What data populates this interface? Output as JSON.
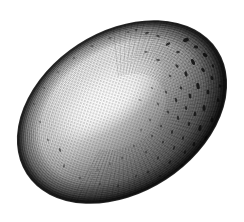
{
  "image": {
    "domain": "Natural-Image",
    "subject_name": "speckled-bird-egg",
    "medium": "engraving-halftone",
    "palette": "monochrome-grayscale",
    "background_color": "#ffffff",
    "outline_color": "#141414",
    "shadow_color": "#1a1a1a",
    "midtone_color": "#8d8d8d",
    "highlight_color": "#ffffff",
    "speckle_color": "#111111",
    "canvas": {
      "width": 244,
      "height": 222
    },
    "caption": ""
  },
  "geometry": {
    "ellipse": {
      "center_x": 122,
      "center_y": 112,
      "radius_x": 113,
      "radius_y": 80,
      "rotation_deg": -33
    },
    "extents": {
      "left_x": 12,
      "right_x": 233,
      "top_y": 14,
      "bottom_y": 210
    },
    "highlight": {
      "center_x": 108,
      "center_y": 98,
      "radius_x": 66,
      "radius_y": 30,
      "rotation_deg": -33
    }
  },
  "shading": {
    "light_direction": "upper-left",
    "darkest_region": "lower-right-rim",
    "terminator_note": "bright diagonal highlight runs lower-left to upper-right through the center",
    "rim_darkening": "continuous dark outline all around the silhouette"
  },
  "texture": {
    "engraving_lines": "fine curved hatching following the shell contour",
    "line_count": 46,
    "speckle_count": 96,
    "speckle_distribution": "dense on the right and upper-right shadowed side, sparse on the lit left side"
  },
  "speckles": [
    {
      "x": 186,
      "y": 40,
      "rx": 3.0,
      "ry": 2.0,
      "r": -24,
      "o": 0.88
    },
    {
      "x": 196,
      "y": 47,
      "rx": 2.2,
      "ry": 1.5,
      "r": 10,
      "o": 0.82
    },
    {
      "x": 205,
      "y": 55,
      "rx": 2.6,
      "ry": 1.7,
      "r": 40,
      "o": 0.9
    },
    {
      "x": 178,
      "y": 52,
      "rx": 1.8,
      "ry": 1.2,
      "r": -10,
      "o": 0.7
    },
    {
      "x": 168,
      "y": 44,
      "rx": 2.4,
      "ry": 1.3,
      "r": -35,
      "o": 0.8
    },
    {
      "x": 158,
      "y": 36,
      "rx": 1.7,
      "ry": 1.1,
      "r": 15,
      "o": 0.62
    },
    {
      "x": 147,
      "y": 33,
      "rx": 2.0,
      "ry": 1.0,
      "r": -20,
      "o": 0.58
    },
    {
      "x": 136,
      "y": 30,
      "rx": 1.5,
      "ry": 1.0,
      "r": 0,
      "o": 0.5
    },
    {
      "x": 193,
      "y": 62,
      "rx": 3.2,
      "ry": 1.6,
      "r": 65,
      "o": 0.92
    },
    {
      "x": 203,
      "y": 70,
      "rx": 2.4,
      "ry": 1.5,
      "r": 55,
      "o": 0.88
    },
    {
      "x": 212,
      "y": 78,
      "rx": 2.0,
      "ry": 1.4,
      "r": 70,
      "o": 0.85
    },
    {
      "x": 186,
      "y": 74,
      "rx": 2.8,
      "ry": 1.4,
      "r": 75,
      "o": 0.86
    },
    {
      "x": 177,
      "y": 66,
      "rx": 2.0,
      "ry": 1.2,
      "r": 50,
      "o": 0.72
    },
    {
      "x": 198,
      "y": 86,
      "rx": 3.4,
      "ry": 1.6,
      "r": 80,
      "o": 0.9
    },
    {
      "x": 208,
      "y": 92,
      "rx": 2.2,
      "ry": 1.5,
      "r": 85,
      "o": 0.86
    },
    {
      "x": 190,
      "y": 96,
      "rx": 2.6,
      "ry": 1.3,
      "r": 80,
      "o": 0.84
    },
    {
      "x": 181,
      "y": 88,
      "rx": 1.8,
      "ry": 1.2,
      "r": 60,
      "o": 0.7
    },
    {
      "x": 218,
      "y": 100,
      "rx": 2.0,
      "ry": 1.3,
      "r": 88,
      "o": 0.8
    },
    {
      "x": 204,
      "y": 108,
      "rx": 3.0,
      "ry": 1.5,
      "r": 90,
      "o": 0.88
    },
    {
      "x": 195,
      "y": 114,
      "rx": 2.2,
      "ry": 1.3,
      "r": 95,
      "o": 0.84
    },
    {
      "x": 186,
      "y": 108,
      "rx": 1.9,
      "ry": 1.2,
      "r": 85,
      "o": 0.74
    },
    {
      "x": 176,
      "y": 100,
      "rx": 2.4,
      "ry": 1.1,
      "r": 70,
      "o": 0.72
    },
    {
      "x": 166,
      "y": 92,
      "rx": 1.6,
      "ry": 1.0,
      "r": 55,
      "o": 0.58
    },
    {
      "x": 212,
      "y": 120,
      "rx": 2.4,
      "ry": 1.4,
      "r": 100,
      "o": 0.82
    },
    {
      "x": 200,
      "y": 128,
      "rx": 3.0,
      "ry": 1.5,
      "r": 105,
      "o": 0.88
    },
    {
      "x": 189,
      "y": 124,
      "rx": 2.0,
      "ry": 1.2,
      "r": 95,
      "o": 0.76
    },
    {
      "x": 178,
      "y": 118,
      "rx": 2.2,
      "ry": 1.1,
      "r": 85,
      "o": 0.7
    },
    {
      "x": 168,
      "y": 112,
      "rx": 1.7,
      "ry": 1.0,
      "r": 70,
      "o": 0.6
    },
    {
      "x": 158,
      "y": 104,
      "rx": 1.5,
      "ry": 0.9,
      "r": 60,
      "o": 0.5
    },
    {
      "x": 206,
      "y": 138,
      "rx": 2.6,
      "ry": 1.4,
      "r": 115,
      "o": 0.84
    },
    {
      "x": 194,
      "y": 144,
      "rx": 2.2,
      "ry": 1.3,
      "r": 110,
      "o": 0.8
    },
    {
      "x": 183,
      "y": 138,
      "rx": 1.8,
      "ry": 1.1,
      "r": 100,
      "o": 0.7
    },
    {
      "x": 172,
      "y": 132,
      "rx": 2.0,
      "ry": 1.0,
      "r": 95,
      "o": 0.66
    },
    {
      "x": 161,
      "y": 126,
      "rx": 1.6,
      "ry": 0.9,
      "r": 85,
      "o": 0.56
    },
    {
      "x": 150,
      "y": 120,
      "rx": 1.4,
      "ry": 0.9,
      "r": 75,
      "o": 0.46
    },
    {
      "x": 196,
      "y": 156,
      "rx": 2.4,
      "ry": 1.3,
      "r": 125,
      "o": 0.8
    },
    {
      "x": 185,
      "y": 152,
      "rx": 1.9,
      "ry": 1.1,
      "r": 115,
      "o": 0.72
    },
    {
      "x": 174,
      "y": 148,
      "rx": 2.1,
      "ry": 1.0,
      "r": 110,
      "o": 0.68
    },
    {
      "x": 163,
      "y": 142,
      "rx": 1.6,
      "ry": 0.9,
      "r": 100,
      "o": 0.58
    },
    {
      "x": 152,
      "y": 136,
      "rx": 1.5,
      "ry": 0.9,
      "r": 90,
      "o": 0.48
    },
    {
      "x": 141,
      "y": 130,
      "rx": 1.3,
      "ry": 0.8,
      "r": 80,
      "o": 0.4
    },
    {
      "x": 182,
      "y": 166,
      "rx": 2.2,
      "ry": 1.2,
      "r": 130,
      "o": 0.74
    },
    {
      "x": 170,
      "y": 162,
      "rx": 1.8,
      "ry": 1.0,
      "r": 125,
      "o": 0.66
    },
    {
      "x": 158,
      "y": 158,
      "rx": 1.6,
      "ry": 0.9,
      "r": 115,
      "o": 0.56
    },
    {
      "x": 146,
      "y": 152,
      "rx": 1.5,
      "ry": 0.9,
      "r": 105,
      "o": 0.48
    },
    {
      "x": 134,
      "y": 146,
      "rx": 1.3,
      "ry": 0.8,
      "r": 95,
      "o": 0.38
    },
    {
      "x": 122,
      "y": 158,
      "rx": 1.6,
      "ry": 0.9,
      "r": 100,
      "o": 0.4
    },
    {
      "x": 110,
      "y": 164,
      "rx": 1.4,
      "ry": 0.8,
      "r": 90,
      "o": 0.34
    },
    {
      "x": 98,
      "y": 170,
      "rx": 1.3,
      "ry": 0.8,
      "r": 85,
      "o": 0.3
    },
    {
      "x": 148,
      "y": 172,
      "rx": 1.8,
      "ry": 1.0,
      "r": 130,
      "o": 0.52
    },
    {
      "x": 136,
      "y": 176,
      "rx": 1.5,
      "ry": 0.9,
      "r": 120,
      "o": 0.44
    },
    {
      "x": 160,
      "y": 176,
      "rx": 1.6,
      "ry": 0.9,
      "r": 135,
      "o": 0.56
    },
    {
      "x": 60,
      "y": 150,
      "rx": 2.0,
      "ry": 1.0,
      "r": 70,
      "o": 0.55
    },
    {
      "x": 48,
      "y": 140,
      "rx": 1.5,
      "ry": 0.9,
      "r": 60,
      "o": 0.42
    },
    {
      "x": 40,
      "y": 122,
      "rx": 1.4,
      "ry": 0.9,
      "r": 50,
      "o": 0.38
    },
    {
      "x": 34,
      "y": 104,
      "rx": 1.3,
      "ry": 0.8,
      "r": 40,
      "o": 0.34
    },
    {
      "x": 44,
      "y": 88,
      "rx": 1.3,
      "ry": 0.8,
      "r": 30,
      "o": 0.3
    },
    {
      "x": 58,
      "y": 72,
      "rx": 1.4,
      "ry": 0.9,
      "r": 20,
      "o": 0.32
    },
    {
      "x": 74,
      "y": 58,
      "rx": 1.5,
      "ry": 0.9,
      "r": 10,
      "o": 0.34
    },
    {
      "x": 92,
      "y": 46,
      "rx": 1.6,
      "ry": 0.9,
      "r": 0,
      "o": 0.38
    },
    {
      "x": 110,
      "y": 38,
      "rx": 1.5,
      "ry": 0.9,
      "r": -10,
      "o": 0.4
    },
    {
      "x": 128,
      "y": 32,
      "rx": 1.4,
      "ry": 0.9,
      "r": -15,
      "o": 0.42
    },
    {
      "x": 64,
      "y": 166,
      "rx": 1.8,
      "ry": 1.0,
      "r": 95,
      "o": 0.46
    },
    {
      "x": 80,
      "y": 178,
      "rx": 1.6,
      "ry": 0.9,
      "r": 100,
      "o": 0.42
    },
    {
      "x": 118,
      "y": 186,
      "rx": 1.5,
      "ry": 0.9,
      "r": 115,
      "o": 0.42
    },
    {
      "x": 100,
      "y": 184,
      "rx": 1.4,
      "ry": 0.9,
      "r": 110,
      "o": 0.38
    },
    {
      "x": 213,
      "y": 66,
      "rx": 1.8,
      "ry": 1.1,
      "r": 60,
      "o": 0.78
    },
    {
      "x": 220,
      "y": 86,
      "rx": 1.7,
      "ry": 1.1,
      "r": 80,
      "o": 0.76
    },
    {
      "x": 222,
      "y": 110,
      "rx": 1.6,
      "ry": 1.1,
      "r": 95,
      "o": 0.74
    },
    {
      "x": 216,
      "y": 132,
      "rx": 1.7,
      "ry": 1.0,
      "r": 110,
      "o": 0.72
    },
    {
      "x": 158,
      "y": 60,
      "rx": 2.2,
      "ry": 1.0,
      "r": 5,
      "o": 0.6
    },
    {
      "x": 146,
      "y": 52,
      "rx": 1.6,
      "ry": 0.9,
      "r": -5,
      "o": 0.5
    },
    {
      "x": 170,
      "y": 76,
      "rx": 1.5,
      "ry": 0.9,
      "r": 45,
      "o": 0.58
    },
    {
      "x": 152,
      "y": 88,
      "rx": 1.4,
      "ry": 0.8,
      "r": 40,
      "o": 0.38
    },
    {
      "x": 140,
      "y": 100,
      "rx": 1.3,
      "ry": 0.8,
      "r": 35,
      "o": 0.3
    },
    {
      "x": 196,
      "y": 170,
      "rx": 1.8,
      "ry": 1.0,
      "r": 140,
      "o": 0.62
    },
    {
      "x": 176,
      "y": 180,
      "rx": 1.6,
      "ry": 0.9,
      "r": 140,
      "o": 0.52
    },
    {
      "x": 204,
      "y": 152,
      "rx": 1.7,
      "ry": 1.0,
      "r": 120,
      "o": 0.76
    }
  ]
}
